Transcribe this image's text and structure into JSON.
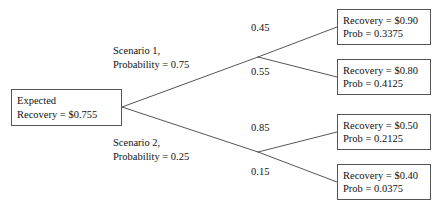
{
  "diagram": {
    "type": "probability-tree",
    "stroke_color": "#555555",
    "text_color": "#111111",
    "background_color": "#ffffff"
  },
  "root": {
    "line1": "Expected",
    "line2": "Recovery = $0.755",
    "value": 0.755
  },
  "scenarios": [
    {
      "line1": "Scenario 1,",
      "line2": "Probability = 0.75",
      "probability": 0.75
    },
    {
      "line1": "Scenario 2,",
      "line2": "Probability = 0.25",
      "probability": 0.25
    }
  ],
  "branch_probabilities": [
    {
      "label": "0.45",
      "value": 0.45
    },
    {
      "label": "0.55",
      "value": 0.55
    },
    {
      "label": "0.85",
      "value": 0.85
    },
    {
      "label": "0.15",
      "value": 0.15
    }
  ],
  "outcomes": [
    {
      "recovery_line": "Recovery = $0.90",
      "prob_line": "Prob = 0.3375",
      "recovery": 0.9,
      "probability": 0.3375
    },
    {
      "recovery_line": "Recovery = $0.80",
      "prob_line": "Prob = 0.4125",
      "recovery": 0.8,
      "probability": 0.4125
    },
    {
      "recovery_line": "Recovery = $0.50",
      "prob_line": "Prob = 0.2125",
      "recovery": 0.5,
      "probability": 0.2125
    },
    {
      "recovery_line": "Recovery = $0.40",
      "prob_line": "Prob = 0.0375",
      "recovery": 0.4,
      "probability": 0.0375
    }
  ]
}
